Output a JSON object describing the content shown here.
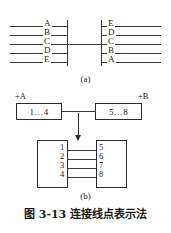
{
  "figure": {
    "caption": "图 3-13  连接线点表示法",
    "part_a": {
      "sub_caption": "(a)",
      "left_block": {
        "terminals": [
          "A",
          "B",
          "C",
          "D",
          "E"
        ]
      },
      "right_block": {
        "terminals": [
          "E",
          "D",
          "C",
          "B",
          "A"
        ]
      },
      "connecting_terminal": "C"
    },
    "part_b": {
      "sub_caption": "(b)",
      "upper": {
        "left_device": {
          "designator": "+A",
          "range": "1…4"
        },
        "right_device": {
          "designator": "+B",
          "range": "5…8"
        }
      },
      "lower": {
        "left_pins": [
          "1",
          "2",
          "3",
          "4"
        ],
        "right_pins": [
          "5",
          "6",
          "7",
          "8"
        ],
        "links": [
          {
            "from": "1",
            "to": "5"
          },
          {
            "from": "2",
            "to": "6"
          },
          {
            "from": "3",
            "to": "7"
          },
          {
            "from": "4",
            "to": "8"
          }
        ]
      }
    },
    "colors": {
      "ink": "#2b2b2b",
      "line": "#3a3a3a",
      "background": "#ffffff"
    }
  }
}
